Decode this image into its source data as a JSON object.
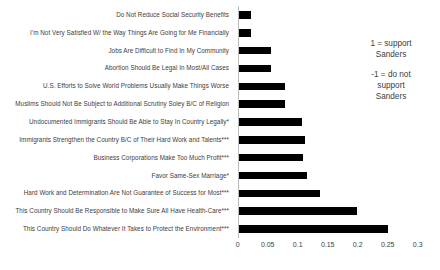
{
  "chart_data": {
    "type": "bar",
    "orientation": "horizontal",
    "title": "",
    "xlabel": "",
    "ylabel": "",
    "xlim": [
      0,
      0.3
    ],
    "xticks": [
      "0",
      "0.05",
      "0.1",
      "0.15",
      "0.2",
      "0.25",
      "0.3"
    ],
    "xtick_values": [
      0,
      0.05,
      0.1,
      0.15,
      0.2,
      0.25,
      0.3
    ],
    "grid": false,
    "legend": null,
    "bar_color": "#000000",
    "axis_color": "#bfbfbf",
    "categories": [
      "Do Not Reduce Social Security Benefits",
      "I'm Not Very Satisfied W/ the Way Things Are Going for Me Financially",
      "Jobs Are Difficult to Find In My Community",
      "Abortion Should Be Legal In Most/All Cases",
      "U.S. Efforts to Solve World Problems Usually Make Things Worse",
      "Muslims Should Not Be Subject to Additional Scrutiny Soley B/C of Religion",
      "Undocumented Immigrants Should Be Able to Stay In Country Legally*",
      "Immigrants Strengthen the Country B/C of Their Hard Work and Talents***",
      "Business Corporations Make Too Much Profit***",
      "Favor Same-Sex Marriage*",
      "Hard Work and Determination Are Not Guarantee of Success for Most***",
      "This Country Should Be Responsible to Make Sure All Have Health-Care***",
      "This Country Should Do Whatever It Takes to Protect the Environment***"
    ],
    "values": [
      0.021,
      0.021,
      0.054,
      0.054,
      0.077,
      0.078,
      0.105,
      0.111,
      0.107,
      0.114,
      0.135,
      0.197,
      0.249
    ],
    "annotations": [
      "1 = support Sanders",
      "-1 = do not support Sanders"
    ]
  },
  "annotation": {
    "line1": "1 = support",
    "line2": "Sanders",
    "line3": "-1 = do not",
    "line4": "support",
    "line5": "Sanders"
  }
}
